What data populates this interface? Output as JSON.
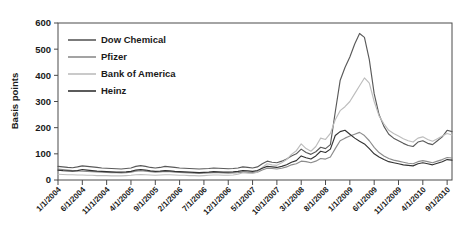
{
  "chart_data": {
    "type": "line",
    "title": "",
    "xlabel": "",
    "ylabel": "Basis points",
    "ylim": [
      0,
      600
    ],
    "yticks": [
      0,
      100,
      200,
      300,
      400,
      500,
      600
    ],
    "grid": false,
    "legend_position": "top-left",
    "xtick_labels": [
      "1/1/2004",
      "6/1/2004",
      "11/1/2004",
      "4/1/2005",
      "9/1/2005",
      "2/1/2006",
      "7/1/2006",
      "12/1/2006",
      "5/1/2007",
      "10/1/2007",
      "3/1/2008",
      "8/1/2008",
      "1/1/2009",
      "6/1/2009",
      "11/1/2009",
      "4/1/2010",
      "9/1/2010"
    ],
    "x": [
      "1/1/2004",
      "2/1/2004",
      "3/1/2004",
      "4/1/2004",
      "5/1/2004",
      "6/1/2004",
      "7/1/2004",
      "8/1/2004",
      "9/1/2004",
      "10/1/2004",
      "11/1/2004",
      "12/1/2004",
      "1/1/2005",
      "2/1/2005",
      "3/1/2005",
      "4/1/2005",
      "5/1/2005",
      "6/1/2005",
      "7/1/2005",
      "8/1/2005",
      "9/1/2005",
      "10/1/2005",
      "11/1/2005",
      "12/1/2005",
      "1/1/2006",
      "2/1/2006",
      "3/1/2006",
      "4/1/2006",
      "5/1/2006",
      "6/1/2006",
      "7/1/2006",
      "8/1/2006",
      "9/1/2006",
      "10/1/2006",
      "11/1/2006",
      "12/1/2006",
      "1/1/2007",
      "2/1/2007",
      "3/1/2007",
      "4/1/2007",
      "5/1/2007",
      "6/1/2007",
      "7/1/2007",
      "8/1/2007",
      "9/1/2007",
      "10/1/2007",
      "11/1/2007",
      "12/1/2007",
      "1/1/2008",
      "2/1/2008",
      "3/1/2008",
      "4/1/2008",
      "5/1/2008",
      "6/1/2008",
      "7/1/2008",
      "8/1/2008",
      "9/1/2008",
      "10/1/2008",
      "11/1/2008",
      "12/1/2008",
      "1/1/2009",
      "2/1/2009",
      "3/1/2009",
      "4/1/2009",
      "5/1/2009",
      "6/1/2009",
      "7/1/2009",
      "8/1/2009",
      "9/1/2009",
      "10/1/2009",
      "11/1/2009",
      "12/1/2009",
      "1/1/2010",
      "2/1/2010",
      "3/1/2010",
      "4/1/2010",
      "5/1/2010",
      "6/1/2010",
      "7/1/2010",
      "8/1/2010",
      "9/1/2010",
      "10/1/2010"
    ],
    "series": [
      {
        "name": "Dow Chemical",
        "color": "#5a5a5a",
        "values": [
          52,
          50,
          48,
          47,
          50,
          54,
          52,
          50,
          48,
          46,
          45,
          44,
          43,
          42,
          44,
          46,
          52,
          55,
          52,
          48,
          46,
          48,
          52,
          50,
          48,
          46,
          45,
          44,
          43,
          42,
          43,
          44,
          46,
          45,
          44,
          43,
          44,
          46,
          50,
          48,
          46,
          50,
          62,
          72,
          68,
          66,
          72,
          80,
          92,
          100,
          118,
          105,
          98,
          108,
          125,
          120,
          135,
          260,
          380,
          430,
          470,
          520,
          560,
          545,
          460,
          330,
          250,
          205,
          175,
          160,
          150,
          140,
          132,
          128,
          145,
          150,
          140,
          135,
          150,
          165,
          190,
          185
        ]
      },
      {
        "name": "Pfizer",
        "color": "#8c8c8c",
        "values": [
          42,
          40,
          38,
          36,
          35,
          34,
          33,
          32,
          31,
          30,
          29,
          28,
          28,
          27,
          28,
          30,
          34,
          36,
          34,
          32,
          30,
          31,
          33,
          32,
          30,
          29,
          28,
          27,
          26,
          25,
          26,
          27,
          28,
          28,
          27,
          26,
          27,
          28,
          30,
          29,
          28,
          30,
          38,
          45,
          44,
          42,
          45,
          50,
          58,
          62,
          72,
          70,
          66,
          72,
          82,
          80,
          88,
          120,
          150,
          160,
          168,
          175,
          182,
          170,
          150,
          125,
          105,
          92,
          82,
          76,
          72,
          68,
          64,
          62,
          70,
          74,
          70,
          66,
          72,
          78,
          86,
          84
        ]
      },
      {
        "name": "Bank of America",
        "color": "#bdbdbd",
        "values": [
          22,
          21,
          20,
          20,
          19,
          19,
          18,
          18,
          17,
          17,
          17,
          16,
          16,
          16,
          17,
          18,
          20,
          21,
          20,
          19,
          18,
          19,
          20,
          20,
          19,
          18,
          18,
          17,
          17,
          16,
          17,
          18,
          19,
          19,
          18,
          18,
          19,
          22,
          28,
          26,
          25,
          30,
          48,
          62,
          58,
          56,
          66,
          78,
          98,
          112,
          138,
          120,
          110,
          128,
          160,
          155,
          178,
          230,
          265,
          280,
          300,
          330,
          360,
          390,
          370,
          300,
          245,
          215,
          190,
          178,
          168,
          158,
          150,
          145,
          160,
          165,
          155,
          148,
          158,
          168,
          178,
          172
        ]
      },
      {
        "name": "Heinz",
        "color": "#333333",
        "values": [
          38,
          36,
          35,
          34,
          36,
          40,
          38,
          36,
          34,
          33,
          32,
          31,
          30,
          30,
          31,
          33,
          38,
          40,
          38,
          35,
          33,
          34,
          36,
          35,
          33,
          32,
          31,
          30,
          29,
          28,
          29,
          30,
          32,
          31,
          30,
          30,
          31,
          33,
          36,
          35,
          33,
          36,
          45,
          52,
          50,
          48,
          52,
          58,
          68,
          74,
          92,
          85,
          80,
          92,
          110,
          105,
          118,
          170,
          185,
          190,
          175,
          160,
          148,
          138,
          120,
          100,
          88,
          78,
          70,
          66,
          62,
          58,
          56,
          54,
          62,
          66,
          62,
          58,
          64,
          70,
          78,
          76
        ]
      }
    ]
  },
  "legend": {
    "items": [
      {
        "label": "Dow Chemical"
      },
      {
        "label": "Pfizer"
      },
      {
        "label": "Bank of America"
      },
      {
        "label": "Heinz"
      }
    ]
  }
}
